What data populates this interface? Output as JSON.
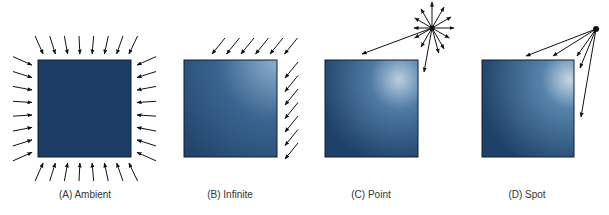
{
  "figure": {
    "panels": [
      {
        "id": "ambient",
        "label": "(A) Ambient",
        "light_type": "ambient"
      },
      {
        "id": "infinite",
        "label": "(B) Infinite",
        "light_type": "infinite"
      },
      {
        "id": "point",
        "label": "(C) Point",
        "light_type": "point"
      },
      {
        "id": "spot",
        "label": "(D) Spot",
        "light_type": "spot"
      }
    ],
    "colors": {
      "square_dark": "#1c3f6b",
      "square_light": "#b8cde0",
      "arrow": "#111111"
    }
  }
}
